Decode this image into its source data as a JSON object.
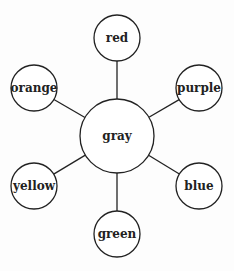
{
  "diagram": {
    "type": "hub-and-spoke",
    "center": {
      "label": "gray",
      "x": 117,
      "y": 136,
      "r": 37
    },
    "nodes": [
      {
        "label": "red",
        "x": 117,
        "y": 38,
        "r": 23
      },
      {
        "label": "purple",
        "x": 199,
        "y": 88,
        "r": 23
      },
      {
        "label": "blue",
        "x": 199,
        "y": 186,
        "r": 23
      },
      {
        "label": "green",
        "x": 117,
        "y": 234,
        "r": 23
      },
      {
        "label": "yellow",
        "x": 34,
        "y": 186,
        "r": 23
      },
      {
        "label": "orange",
        "x": 34,
        "y": 88,
        "r": 23
      }
    ]
  }
}
